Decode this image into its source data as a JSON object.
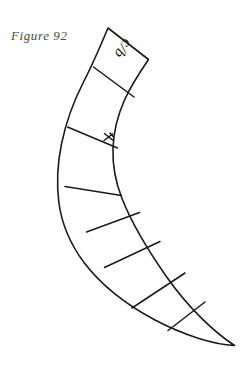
{
  "figure": {
    "caption": "Figure  92",
    "background_color": "#ffffff",
    "ink_color": "#1a1a1a",
    "caption_color": "#4a4a4a",
    "width": 248,
    "height": 369,
    "kind": "line-drawing"
  },
  "labels": {
    "segment_top": "c/b",
    "tick": "x"
  },
  "geometry": {
    "outer_edge_note": "convex left/lower curve of crescent",
    "inner_edge_note": "concave right/upper curve of crescent",
    "tip_note": "pointed tail at lower right",
    "divider_count": 7,
    "segment_count": 8
  }
}
